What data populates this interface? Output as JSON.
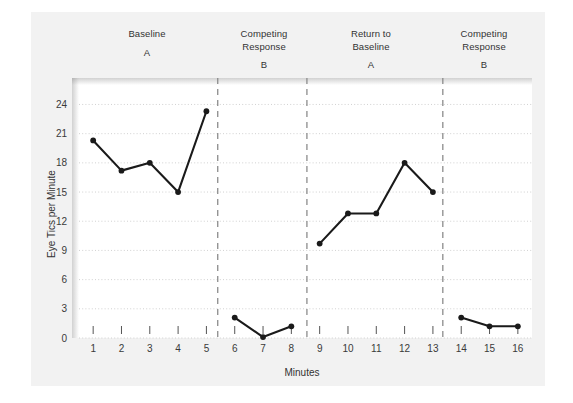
{
  "figure": {
    "background_color": "#f2f2f2",
    "plot_background_color": "#ffffff",
    "line_color": "#1a1a1a",
    "grid_color": "#cccccc",
    "divider_color": "#8c8c8c"
  },
  "phases": [
    {
      "name": "Baseline",
      "letter": "A",
      "center_x": 147
    },
    {
      "name": "Competing\nResponse",
      "letter": "B",
      "center_x": 264
    },
    {
      "name": "Return to\nBaseline",
      "letter": "A",
      "center_x": 371
    },
    {
      "name": "Competing\nResponse",
      "letter": "B",
      "center_x": 484
    }
  ],
  "chart_data": {
    "type": "line",
    "title": "",
    "xlabel": "Minutes",
    "ylabel": "Eye Tics per Minute",
    "x": [
      1,
      2,
      3,
      4,
      5,
      6,
      7,
      8,
      9,
      10,
      11,
      12,
      13,
      14,
      15,
      16
    ],
    "xtick_labels": [
      "1",
      "2",
      "3",
      "4",
      "5",
      "6",
      "7",
      "8",
      "9",
      "10",
      "11",
      "12",
      "13",
      "14",
      "15",
      "16"
    ],
    "ytick_labels": [
      "0",
      "3",
      "6",
      "9",
      "12",
      "15",
      "18",
      "21",
      "24"
    ],
    "yticks": [
      0,
      3,
      6,
      9,
      12,
      15,
      18,
      21,
      24
    ],
    "xlim": [
      0.5,
      16.5
    ],
    "ylim": [
      0,
      26
    ],
    "grid": true,
    "legend": "none",
    "series": [
      {
        "name": "Baseline A",
        "x": [
          1,
          2,
          3,
          4,
          5
        ],
        "values": [
          20.3,
          17.2,
          18.0,
          15.0,
          23.3
        ]
      },
      {
        "name": "Competing Response B",
        "x": [
          6,
          7,
          8
        ],
        "values": [
          2.1,
          0.1,
          1.2
        ]
      },
      {
        "name": "Return to Baseline A",
        "x": [
          9,
          10,
          11,
          12,
          13
        ],
        "values": [
          9.7,
          12.8,
          12.8,
          18.0,
          15.0
        ]
      },
      {
        "name": "Competing Response B (2)",
        "x": [
          14,
          15,
          16
        ],
        "values": [
          2.1,
          1.2,
          1.2
        ]
      }
    ],
    "phase_dividers": [
      5.4,
      8.55,
      13.35
    ],
    "annotations": [
      "Baseline A",
      "Competing Response B",
      "Return to Baseline A",
      "Competing Response B"
    ]
  }
}
